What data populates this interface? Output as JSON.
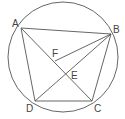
{
  "diagram": {
    "stroke_color": "#555555",
    "circle": {
      "cx": 63,
      "cy": 57,
      "r": 55
    },
    "points": {
      "A": {
        "label": "A",
        "x": 21,
        "y": 28,
        "lx": 12,
        "ly": 27
      },
      "B": {
        "label": "B",
        "x": 111,
        "y": 34,
        "lx": 113,
        "ly": 33
      },
      "C": {
        "label": "C",
        "x": 92,
        "y": 101,
        "lx": 94,
        "ly": 112
      },
      "D": {
        "label": "D",
        "x": 35,
        "y": 101,
        "lx": 26,
        "ly": 112
      },
      "E": {
        "label": "E",
        "x": 67,
        "y": 72,
        "lx": 71,
        "ly": 79
      },
      "F": {
        "label": "F",
        "x": 55,
        "y": 61,
        "lx": 52,
        "ly": 57
      }
    },
    "segments": [
      "AB",
      "BC",
      "CD",
      "DA",
      "AC",
      "BD",
      "BF"
    ]
  }
}
